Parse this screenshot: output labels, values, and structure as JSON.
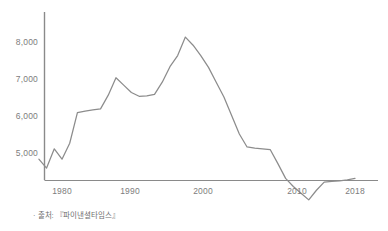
{
  "caption": "· 출처: 『파이낸셜타임스』",
  "axes": {
    "y_ticks": [
      "5,000",
      "6,000",
      "7,000",
      "8,000"
    ],
    "x_ticks": [
      "1980",
      "1990",
      "2000",
      "2010",
      "2018"
    ]
  },
  "colors": {
    "line": "#8c8c8c",
    "axis": "#8a8a8a",
    "tick_text": "#7d7d7d",
    "caption_text": "#6f6f6f",
    "background": "#ffffff"
  },
  "chart_data": {
    "type": "line",
    "title": "",
    "xlabel": "",
    "ylabel": "",
    "xlim": [
      1977,
      2018
    ],
    "ylim": [
      3650,
      8450
    ],
    "grid": false,
    "legend": null,
    "yticks": [
      5000,
      6000,
      7000,
      8000
    ],
    "ytick_labels": [
      "5,000",
      "6,000",
      "7,000",
      "8,000"
    ],
    "xticks": [
      1980,
      1990,
      2000,
      2010,
      2018
    ],
    "xtick_labels": [
      "1980",
      "1990",
      "2000",
      "2010",
      "2018"
    ],
    "series": [
      {
        "name": "value",
        "x": [
          1977,
          1978,
          1979,
          1980,
          1981,
          1982,
          1983,
          1984,
          1985,
          1986,
          1987,
          1988,
          1989,
          1990,
          1991,
          1992,
          1993,
          1994,
          1995,
          1996,
          1997,
          1998,
          1999,
          2000,
          2001,
          2002,
          2003,
          2004,
          2005,
          2006,
          2007,
          2008,
          2009,
          2010,
          2011,
          2012,
          2013,
          2014,
          2015,
          2016,
          2017,
          2018
        ],
        "y": [
          4820,
          4580,
          5100,
          4820,
          5250,
          6080,
          6120,
          6150,
          6180,
          6550,
          7020,
          6820,
          6620,
          6520,
          6530,
          6570,
          6900,
          7320,
          7620,
          8120,
          7900,
          7620,
          7300,
          6900,
          6500,
          6000,
          5500,
          5150,
          5120,
          5100,
          5080,
          4700,
          4300,
          4080,
          3900,
          3720,
          3980,
          4200,
          4220,
          4230,
          4260,
          4300
        ]
      }
    ]
  }
}
